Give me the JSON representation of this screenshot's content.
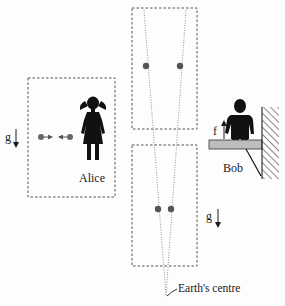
{
  "labels": {
    "alice": "Alice",
    "bob": "Bob",
    "earth_centre": "Earth's centre",
    "gravity_left": "g",
    "gravity_right": "g",
    "force": "f"
  },
  "colors": {
    "ink": "#1a1a1a",
    "dot": "#555555",
    "dotted_line": "#777777",
    "box_border": "#555555",
    "platform_fill": "#bdbdbd"
  },
  "frames": [
    {
      "id": "alice-frame",
      "x": 28,
      "y": 78,
      "w": 87,
      "h": 119
    },
    {
      "id": "upper-falling-frame",
      "x": 132,
      "y": 8,
      "w": 65,
      "h": 121
    },
    {
      "id": "lower-falling-frame",
      "x": 132,
      "y": 145,
      "w": 65,
      "h": 121
    }
  ],
  "particles": {
    "alice": [
      {
        "x": 41,
        "y": 137
      },
      {
        "x": 70,
        "y": 137
      }
    ],
    "upper": [
      {
        "x": 146,
        "y": 66
      },
      {
        "x": 180,
        "y": 66
      }
    ],
    "lower": [
      {
        "x": 158,
        "y": 209
      },
      {
        "x": 171,
        "y": 209
      }
    ]
  },
  "convergence_point": {
    "x": 166,
    "y": 296
  }
}
